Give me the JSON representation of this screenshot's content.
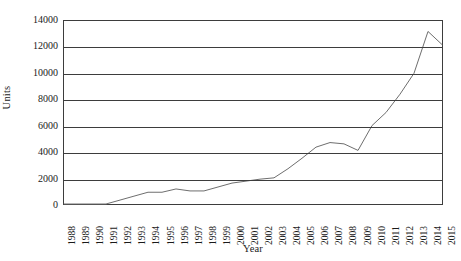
{
  "chart_data": {
    "type": "line",
    "title": "",
    "xlabel": "Year",
    "ylabel": "Units",
    "categories": [
      "1988",
      "1989",
      "1990",
      "1991",
      "1992",
      "1993",
      "1994",
      "1995",
      "1996",
      "1997",
      "1998",
      "1999",
      "2000",
      "2001",
      "2002",
      "2003",
      "2004",
      "2005",
      "2006",
      "2007",
      "2008",
      "2009",
      "2010",
      "2011",
      "2012",
      "2013",
      "2014",
      "2015"
    ],
    "values": [
      0,
      0,
      0,
      0,
      300,
      600,
      900,
      900,
      1150,
      1000,
      1000,
      1300,
      1600,
      1750,
      1900,
      2000,
      2700,
      3500,
      4350,
      4700,
      4600,
      4100,
      6000,
      7000,
      8400,
      10000,
      13200,
      12200
    ],
    "series": [
      {
        "name": "Units",
        "color": "#6e6e6e",
        "values": [
          0,
          0,
          0,
          0,
          300,
          600,
          900,
          900,
          1150,
          1000,
          1000,
          1300,
          1600,
          1750,
          1900,
          2000,
          2700,
          3500,
          4350,
          4700,
          4600,
          4100,
          6000,
          7000,
          8400,
          10000,
          13200,
          12200
        ]
      }
    ],
    "ylim": [
      0,
      14000
    ],
    "ytick_labels": [
      "0",
      "2000",
      "4000",
      "6000",
      "8000",
      "10000",
      "12000",
      "14000"
    ],
    "ytick_values": [
      0,
      2000,
      4000,
      6000,
      8000,
      10000,
      12000,
      14000
    ],
    "grid": true,
    "grid_axis": "y",
    "legend": false,
    "legend_position": "none",
    "markers": false,
    "line_color": "#6e6e6e",
    "axis_color": "#3d3d3d",
    "background_color": "#ffffff"
  }
}
